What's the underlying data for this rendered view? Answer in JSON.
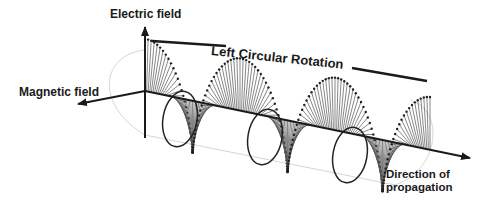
{
  "diagram": {
    "title": "Left Circular Rotation",
    "labels": {
      "electric_field": "Electric field",
      "magnetic_field": "Magnetic field",
      "rotation": "Left Circular Rotation",
      "direction_line1": "Direction of",
      "direction_line2": "propagation"
    },
    "colors": {
      "ink": "#1a1a1a",
      "spoke": "#444444",
      "faint_cylinder": "#d0d0d0",
      "background": "#ffffff"
    },
    "elements": [
      "electric-field-axis (vertical arrow up)",
      "magnetic-field-axis (arrow pointing left-down)",
      "propagation-axis (arrow to the right-down)",
      "helical field vectors forming circular polarization",
      "rotation indicator lines"
    ]
  }
}
